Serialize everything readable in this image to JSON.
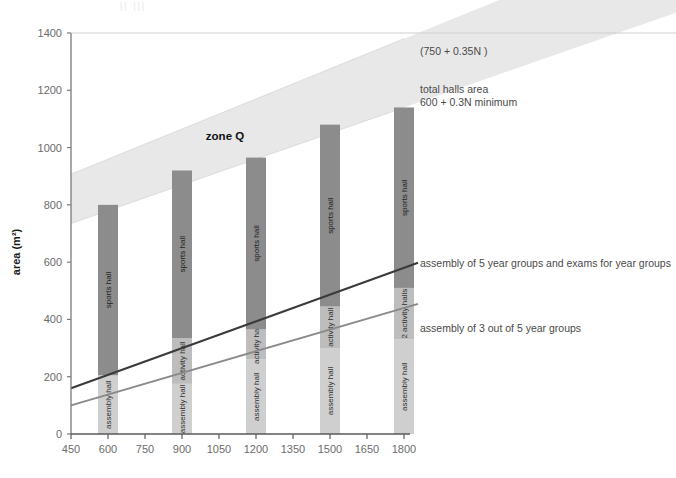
{
  "figure": {
    "top_faint_text": "||  |||",
    "zone_label": "zone Q"
  },
  "annotations": {
    "upper_bound": "(750 + 0.35N )",
    "total_halls_line1": "total halls area",
    "total_halls_line2": "600 + 0.3N minimum",
    "assembly5": "assembly of 5 year groups and exams for year groups",
    "assembly3": "assembly of 3 out of 5 year groups"
  },
  "colors": {
    "band_fill": "#e8e8e8",
    "bar_dark": "#8c8c8c",
    "bar_mid": "#bdbdbd",
    "bar_light": "#cfcfcf",
    "line_dark": "#3a3a3a",
    "line_mid": "#8a8a8a",
    "axis": "#7a7a7a",
    "text": "#4a4a4a"
  },
  "chart_data": {
    "type": "bar",
    "title": "",
    "xlabel": "",
    "ylabel": "area (m²)",
    "xlim": [
      450,
      1800
    ],
    "ylim": [
      0,
      1400
    ],
    "xticks": [
      450,
      600,
      750,
      900,
      1050,
      1200,
      1350,
      1500,
      1650,
      1800
    ],
    "yticks": [
      0,
      200,
      400,
      600,
      800,
      1000,
      1200,
      1400
    ],
    "grid": false,
    "legend": "none",
    "categories": [
      600,
      900,
      1200,
      1500,
      1800
    ],
    "bars": [
      {
        "x": 600,
        "total": 800,
        "segments": [
          {
            "label": "sports hall",
            "value": 595,
            "shade": "dark"
          },
          {
            "label": "assembly hall",
            "value": 205,
            "shade": "light"
          }
        ]
      },
      {
        "x": 900,
        "total": 920,
        "segments": [
          {
            "label": "sports hall",
            "value": 585,
            "shade": "dark"
          },
          {
            "label": "activity hall",
            "value": 160,
            "shade": "mid"
          },
          {
            "label": "assembly hall",
            "value": 175,
            "shade": "light"
          }
        ]
      },
      {
        "x": 1200,
        "total": 965,
        "segments": [
          {
            "label": "sports hall",
            "value": 600,
            "shade": "dark"
          },
          {
            "label": "activity hall",
            "value": 105,
            "shade": "mid"
          },
          {
            "label": "assembly hall",
            "value": 260,
            "shade": "light"
          }
        ]
      },
      {
        "x": 1500,
        "total": 1080,
        "segments": [
          {
            "label": "sports hall",
            "value": 635,
            "shade": "dark"
          },
          {
            "label": "activity hall",
            "value": 145,
            "shade": "mid"
          },
          {
            "label": "assembly hall",
            "value": 300,
            "shade": "light"
          }
        ]
      },
      {
        "x": 1800,
        "total": 1140,
        "segments": [
          {
            "label": "sports hall",
            "value": 630,
            "shade": "dark"
          },
          {
            "label": "2 activity halls",
            "value": 180,
            "shade": "mid"
          },
          {
            "label": "assembly hall",
            "value": 330,
            "shade": "light"
          }
        ]
      }
    ],
    "band": {
      "name": "zone Q",
      "upper": {
        "formula": "750 + 0.35N",
        "at_450": 907,
        "at_1800": 1380
      },
      "lower": {
        "formula": "600 + 0.3N",
        "at_450": 735,
        "at_1800": 1140
      }
    },
    "lines": [
      {
        "name": "assembly of 5 year groups and exams for year groups",
        "at_450": 160,
        "at_1800": 580,
        "shade": "dark"
      },
      {
        "name": "assembly of 3 out of 5 year groups",
        "at_450": 100,
        "at_1800": 440,
        "shade": "mid"
      }
    ]
  }
}
